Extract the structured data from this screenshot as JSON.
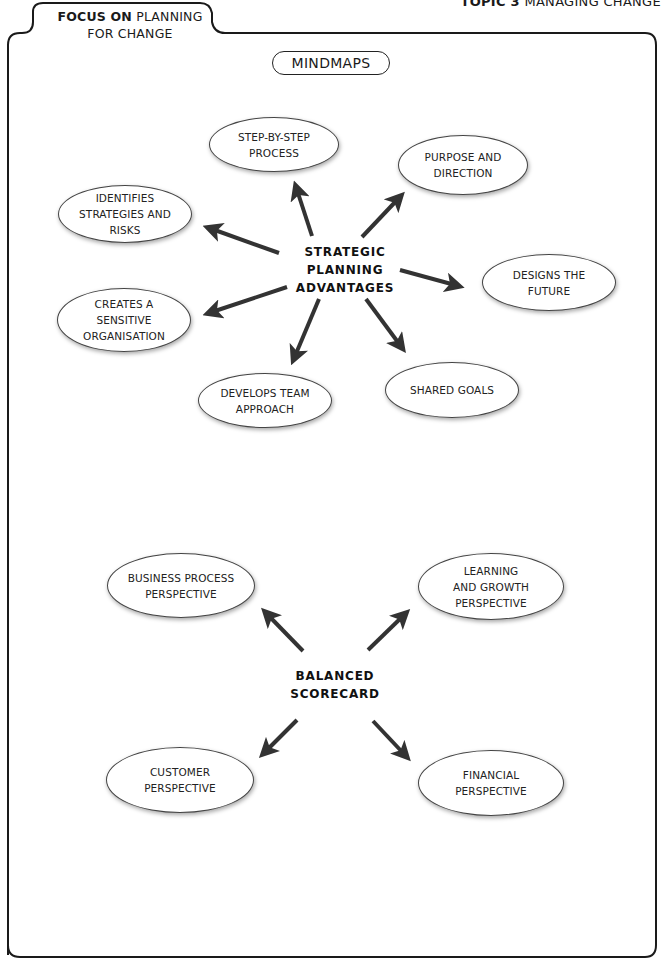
{
  "header": {
    "topic_bold": "TOPIC 3",
    "topic_rest": " MANAGING CHANGE",
    "tab_bold": "FOCUS ON",
    "tab_rest_line1": " PLANNING",
    "tab_line2": "FOR CHANGE"
  },
  "section_title": "MINDMAPS",
  "mindmap_1": {
    "center_lines": [
      "STRATEGIC",
      "PLANNING",
      "ADVANTAGES"
    ],
    "nodes": [
      {
        "lines": [
          "STEP-BY-STEP",
          "PROCESS"
        ]
      },
      {
        "lines": [
          "PURPOSE AND",
          "DIRECTION"
        ]
      },
      {
        "lines": [
          "IDENTIFIES",
          "STRATEGIES AND",
          "RISKS"
        ]
      },
      {
        "lines": [
          "DESIGNS THE",
          "FUTURE"
        ]
      },
      {
        "lines": [
          "CREATES A",
          "SENSITIVE",
          "ORGANISATION"
        ]
      },
      {
        "lines": [
          "SHARED GOALS"
        ]
      },
      {
        "lines": [
          "DEVELOPS TEAM",
          "APPROACH"
        ]
      }
    ]
  },
  "mindmap_2": {
    "center_lines": [
      "BALANCED",
      "SCORECARD"
    ],
    "nodes": [
      {
        "lines": [
          "BUSINESS PROCESS",
          "PERSPECTIVE"
        ]
      },
      {
        "lines": [
          "LEARNING",
          "AND GROWTH",
          "PERSPECTIVE"
        ]
      },
      {
        "lines": [
          "CUSTOMER",
          "PERSPECTIVE"
        ]
      },
      {
        "lines": [
          "FINANCIAL",
          "PERSPECTIVE"
        ]
      }
    ]
  },
  "colors": {
    "stroke": "#222222",
    "arrow": "#333333",
    "background": "#ffffff"
  }
}
